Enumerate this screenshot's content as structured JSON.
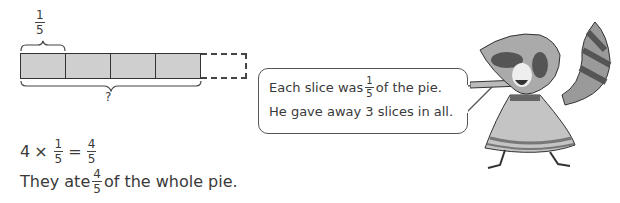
{
  "bar_model": {
    "top_label": {
      "numerator": "1",
      "denominator": "5"
    },
    "filled_parts": 4,
    "total_parts": 5,
    "bottom_label": "?"
  },
  "speech_bubble": {
    "line1_before": "Each slice was",
    "line1_fraction": {
      "numerator": "1",
      "denominator": "5"
    },
    "line1_after": "of the pie.",
    "line2": "He gave away 3 slices in all."
  },
  "equation": {
    "left": "4",
    "times": "×",
    "frac1": {
      "numerator": "1",
      "denominator": "5"
    },
    "equals": "=",
    "result": {
      "numerator": "4",
      "denominator": "5"
    }
  },
  "sentence": {
    "before": "They ate",
    "fraction": {
      "numerator": "4",
      "denominator": "5"
    },
    "after": "of the whole pie."
  },
  "character": {
    "name": "raccoon",
    "pose": "pointing"
  }
}
